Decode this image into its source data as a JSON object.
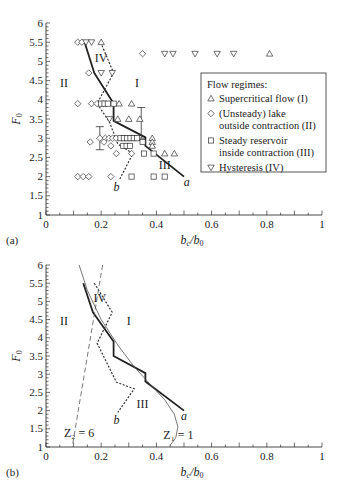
{
  "chart_data": [
    {
      "panel": "(a)",
      "type": "scatter",
      "xlabel": "b_c/b_0",
      "ylabel": "F_0",
      "xlim": [
        0,
        1
      ],
      "ylim": [
        1,
        6
      ],
      "xticks": [
        "0",
        "0.2",
        "0.4",
        "0.6",
        "0.8",
        "1"
      ],
      "yticks": [
        "1",
        "1.5",
        "2",
        "2.5",
        "3",
        "3.5",
        "4",
        "4.5",
        "5",
        "5.5",
        "6"
      ],
      "legend": {
        "title": "Flow regimes:",
        "entries": [
          {
            "marker": "triangle-up",
            "lines": [
              "Supercritical flow (I)"
            ]
          },
          {
            "marker": "diamond",
            "lines": [
              "(Unsteady) lake",
              "outside contraction (II)"
            ]
          },
          {
            "marker": "square",
            "lines": [
              "Steady reservoir",
              "inside contraction (III)"
            ]
          },
          {
            "marker": "triangle-down",
            "lines": [
              "Hysteresis (IV)"
            ]
          }
        ]
      },
      "series": [
        {
          "name": "Supercritical flow (I)",
          "marker": "triangle-up",
          "points": [
            [
              0.2,
              5.5
            ],
            [
              0.81,
              5.2
            ],
            [
              0.265,
              3.9
            ],
            [
              0.31,
              3.9
            ],
            [
              0.26,
              3.5
            ],
            [
              0.3,
              3.5
            ],
            [
              0.34,
              3.5
            ],
            [
              0.385,
              3.0
            ],
            [
              0.385,
              2.9
            ],
            [
              0.385,
              2.8
            ],
            [
              0.43,
              2.6
            ],
            [
              0.465,
              2.6
            ]
          ]
        },
        {
          "name": "(Unsteady) lake outside contraction (II)",
          "marker": "diamond",
          "points": [
            [
              0.115,
              5.5
            ],
            [
              0.13,
              5.5
            ],
            [
              0.35,
              5.2
            ],
            [
              0.155,
              4.7
            ],
            [
              0.115,
              3.9
            ],
            [
              0.165,
              3.9
            ],
            [
              0.185,
              3.9
            ],
            [
              0.16,
              2.9
            ],
            [
              0.195,
              3.0
            ],
            [
              0.215,
              3.0
            ],
            [
              0.228,
              3.0
            ],
            [
              0.241,
              3.0
            ],
            [
              0.254,
              3.0
            ],
            [
              0.21,
              2.9
            ],
            [
              0.235,
              2.8
            ],
            [
              0.255,
              2.6
            ],
            [
              0.31,
              2.6
            ],
            [
              0.115,
              2.0
            ],
            [
              0.135,
              2.0
            ],
            [
              0.155,
              2.0
            ],
            [
              0.235,
              2.0
            ]
          ]
        },
        {
          "name": "Steady reservoir inside contraction (III)",
          "marker": "square",
          "points": [
            [
              0.2,
              3.9
            ],
            [
              0.212,
              3.9
            ],
            [
              0.224,
              3.9
            ],
            [
              0.245,
              3.9
            ],
            [
              0.27,
              3.0
            ],
            [
              0.282,
              3.0
            ],
            [
              0.294,
              3.0
            ],
            [
              0.306,
              3.0
            ],
            [
              0.318,
              3.0
            ],
            [
              0.33,
              3.0
            ],
            [
              0.35,
              2.9
            ],
            [
              0.28,
              2.8
            ],
            [
              0.292,
              2.8
            ],
            [
              0.304,
              2.8
            ],
            [
              0.355,
              2.6
            ],
            [
              0.39,
              2.6
            ],
            [
              0.31,
              2.0
            ],
            [
              0.39,
              2.0
            ],
            [
              0.43,
              2.0
            ]
          ]
        },
        {
          "name": "Hysteresis (IV)",
          "marker": "triangle-down",
          "points": [
            [
              0.145,
              5.5
            ],
            [
              0.165,
              5.5
            ],
            [
              0.43,
              5.2
            ],
            [
              0.46,
              5.2
            ],
            [
              0.54,
              5.2
            ],
            [
              0.62,
              5.2
            ],
            [
              0.68,
              5.2
            ],
            [
              0.2,
              4.7
            ],
            [
              0.24,
              4.7
            ],
            [
              0.23,
              3.5
            ]
          ]
        }
      ],
      "error_bars": [
        {
          "x": 0.195,
          "ymin": 2.7,
          "ymax": 3.3
        },
        {
          "x": 0.345,
          "ymin": 3.0,
          "ymax": 3.8
        }
      ],
      "lines": [
        {
          "name": "a",
          "style": "solid-thick",
          "points": [
            [
              0.14,
              5.5
            ],
            [
              0.175,
              4.7
            ],
            [
              0.245,
              3.9
            ],
            [
              0.245,
              3.45
            ],
            [
              0.36,
              3.02
            ],
            [
              0.36,
              2.8
            ],
            [
              0.5,
              2.0
            ]
          ]
        },
        {
          "name": "b",
          "style": "dotted",
          "points": [
            [
              0.198,
              5.5
            ],
            [
              0.245,
              4.7
            ],
            [
              0.185,
              3.9
            ],
            [
              0.23,
              3.42
            ],
            [
              0.26,
              2.85
            ],
            [
              0.315,
              2.6
            ],
            [
              0.265,
              1.9
            ]
          ]
        }
      ],
      "annotations": [
        {
          "text": "IV",
          "x": 0.2,
          "y": 5.08
        },
        {
          "text": "II",
          "x": 0.065,
          "y": 4.45
        },
        {
          "text": "I",
          "x": 0.33,
          "y": 4.45
        },
        {
          "text": "III",
          "x": 0.43,
          "y": 2.3
        },
        {
          "text": "a",
          "x": 0.51,
          "y": 1.87,
          "italic": true
        },
        {
          "text": "b",
          "x": 0.255,
          "y": 1.72,
          "italic": true
        }
      ]
    },
    {
      "panel": "(b)",
      "type": "line",
      "xlabel": "b_c/b_0",
      "ylabel": "F_0",
      "xlim": [
        0,
        1
      ],
      "ylim": [
        1,
        6
      ],
      "xticks": [
        "0",
        "0.2",
        "0.4",
        "0.6",
        "0.8",
        "1"
      ],
      "yticks": [
        "1",
        "1.5",
        "2",
        "2.5",
        "3",
        "3.5",
        "4",
        "4.5",
        "5",
        "5.5",
        "6"
      ],
      "lines": [
        {
          "name": "a",
          "style": "solid-thick",
          "points": [
            [
              0.135,
              5.5
            ],
            [
              0.17,
              4.7
            ],
            [
              0.245,
              3.9
            ],
            [
              0.245,
              3.5
            ],
            [
              0.36,
              3.03
            ],
            [
              0.36,
              2.8
            ],
            [
              0.5,
              2.0
            ]
          ]
        },
        {
          "name": "b",
          "style": "dotted",
          "points": [
            [
              0.175,
              5.5
            ],
            [
              0.24,
              4.7
            ],
            [
              0.185,
              3.85
            ],
            [
              0.255,
              2.78
            ],
            [
              0.32,
              2.6
            ],
            [
              0.26,
              1.95
            ]
          ]
        },
        {
          "name": "Z1 = 1",
          "style": "solid-thin",
          "points": [
            [
              0.12,
              6.0
            ],
            [
              0.15,
              5.3
            ],
            [
              0.2,
              4.5
            ],
            [
              0.26,
              3.8
            ],
            [
              0.32,
              3.2
            ],
            [
              0.38,
              2.7
            ],
            [
              0.43,
              2.3
            ],
            [
              0.465,
              1.9
            ],
            [
              0.478,
              1.55
            ],
            [
              0.47,
              1.25
            ],
            [
              0.45,
              1.05
            ]
          ]
        },
        {
          "name": "Z2 = 6",
          "style": "dashed",
          "points": [
            [
              0.205,
              6.0
            ],
            [
              0.095,
              1.0
            ]
          ]
        }
      ],
      "annotations": [
        {
          "text": "IV",
          "x": 0.195,
          "y": 5.08
        },
        {
          "text": "II",
          "x": 0.065,
          "y": 4.45
        },
        {
          "text": "I",
          "x": 0.3,
          "y": 4.45
        },
        {
          "text": "III",
          "x": 0.35,
          "y": 2.18
        },
        {
          "text": "a",
          "x": 0.5,
          "y": 1.85,
          "italic": true
        },
        {
          "text": "b",
          "x": 0.255,
          "y": 1.75,
          "italic": true
        },
        {
          "text": "Z₂ = 6",
          "x": 0.12,
          "y": 1.38
        },
        {
          "text": "Z₁ = 1",
          "x": 0.48,
          "y": 1.33
        }
      ]
    }
  ],
  "figure": {
    "panel_labels": [
      "(a)",
      "(b)"
    ],
    "axis_title_x": "b",
    "axis_title_x_sub_num": "c",
    "axis_title_x_den": "b",
    "axis_title_x_sub_den": "0",
    "axis_title_y": "F",
    "axis_title_y_sub": "0"
  }
}
